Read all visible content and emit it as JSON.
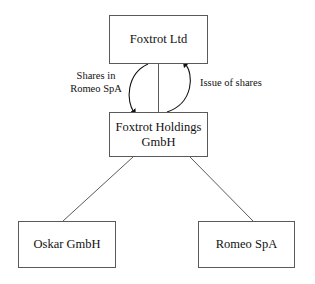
{
  "diagram": {
    "type": "organizational-structure-flow-diagram",
    "background_color": "#ffffff",
    "stroke_color": "#5a5a5a",
    "text_color": "#111111",
    "nodes": [
      {
        "id": "foxtrot-ltd",
        "label": "Foxtrot Ltd"
      },
      {
        "id": "foxtrot-holdings",
        "label": "Foxtrot Holdings\nGmbH"
      },
      {
        "id": "oskar-gmbh",
        "label": "Oskar GmbH"
      },
      {
        "id": "romeo-spa",
        "label": "Romeo SpA"
      }
    ],
    "edge_labels": [
      {
        "id": "shares-in-romeo",
        "label": "Shares in\nRomeo SpA"
      },
      {
        "id": "issue-of-shares",
        "label": "Issue of shares"
      }
    ],
    "edges": [
      {
        "id": "shares-in-romeo-edge",
        "from": "foxtrot-ltd",
        "to": "foxtrot-holdings",
        "style": "curved-arrow",
        "direction": "down",
        "label": "Shares in\nRomeo SpA"
      },
      {
        "id": "issue-of-shares-edge",
        "from": "foxtrot-holdings",
        "to": "foxtrot-ltd",
        "style": "curved-arrow",
        "direction": "up",
        "label": "Issue of shares"
      },
      {
        "id": "ltd-holdings-connector",
        "from": "foxtrot-ltd",
        "to": "foxtrot-holdings",
        "style": "straight-line",
        "direction": "none",
        "label": ""
      },
      {
        "id": "holdings-oskar-edge",
        "from": "foxtrot-holdings",
        "to": "oskar-gmbh",
        "style": "straight-line",
        "direction": "none",
        "label": ""
      },
      {
        "id": "holdings-romeo-edge",
        "from": "foxtrot-holdings",
        "to": "romeo-spa",
        "style": "straight-line",
        "direction": "none",
        "label": ""
      }
    ]
  }
}
